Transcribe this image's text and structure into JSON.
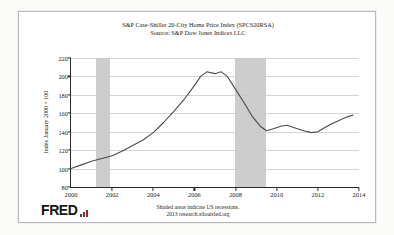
{
  "figure": {
    "title_line1": "S&P Case-Shiller 20-City Home Price Index (SPCS20RSA)",
    "title_line2": "Source: S&P Dow Jones Indices LLC",
    "footnote_line1": "Shaded areas indicate US recessions.",
    "footnote_line2": "2013 research.stlouisfed.org",
    "brand": "FRED",
    "brand_icon": "fred-bars-icon"
  },
  "chart_data": {
    "type": "line",
    "title": "S&P Case-Shiller 20-City Home Price Index (SPCS20RSA)",
    "subtitle": "Source: S&P Dow Jones Indices LLC",
    "xlabel": "",
    "ylabel": "Index January 2000 = 100",
    "xlim": [
      2000,
      2014
    ],
    "ylim": [
      80,
      220
    ],
    "xticks": [
      2000,
      2002,
      2004,
      2006,
      2008,
      2010,
      2012,
      2014
    ],
    "yticks": [
      80,
      100,
      120,
      140,
      160,
      180,
      200,
      220
    ],
    "grid": "horizontal",
    "legend": "none",
    "line_color": "#4a4a4a",
    "recession_color": "#c9c9c9",
    "annotations": [
      "Shaded areas indicate US recessions."
    ],
    "recessions": [
      {
        "start": 2001.2,
        "end": 2001.9
      },
      {
        "start": 2007.95,
        "end": 2009.5
      }
    ],
    "series": [
      {
        "name": "S&P Case-Shiller 20-City Home Price Index",
        "x": [
          2000.0,
          2000.5,
          2001.0,
          2001.5,
          2002.0,
          2002.5,
          2003.0,
          2003.5,
          2004.0,
          2004.5,
          2005.0,
          2005.5,
          2006.0,
          2006.3,
          2006.6,
          2007.0,
          2007.3,
          2007.6,
          2008.0,
          2008.4,
          2008.8,
          2009.2,
          2009.5,
          2009.8,
          2010.2,
          2010.5,
          2010.9,
          2011.3,
          2011.7,
          2012.0,
          2012.3,
          2012.7,
          2013.0,
          2013.4,
          2013.7
        ],
        "values": [
          100,
          104,
          108,
          111,
          114,
          119,
          125,
          131,
          139,
          150,
          162,
          175,
          190,
          200,
          205,
          203,
          205,
          200,
          186,
          172,
          157,
          146,
          141,
          143,
          146,
          147,
          144,
          141,
          139,
          140,
          144,
          149,
          152,
          156,
          158
        ]
      }
    ]
  }
}
